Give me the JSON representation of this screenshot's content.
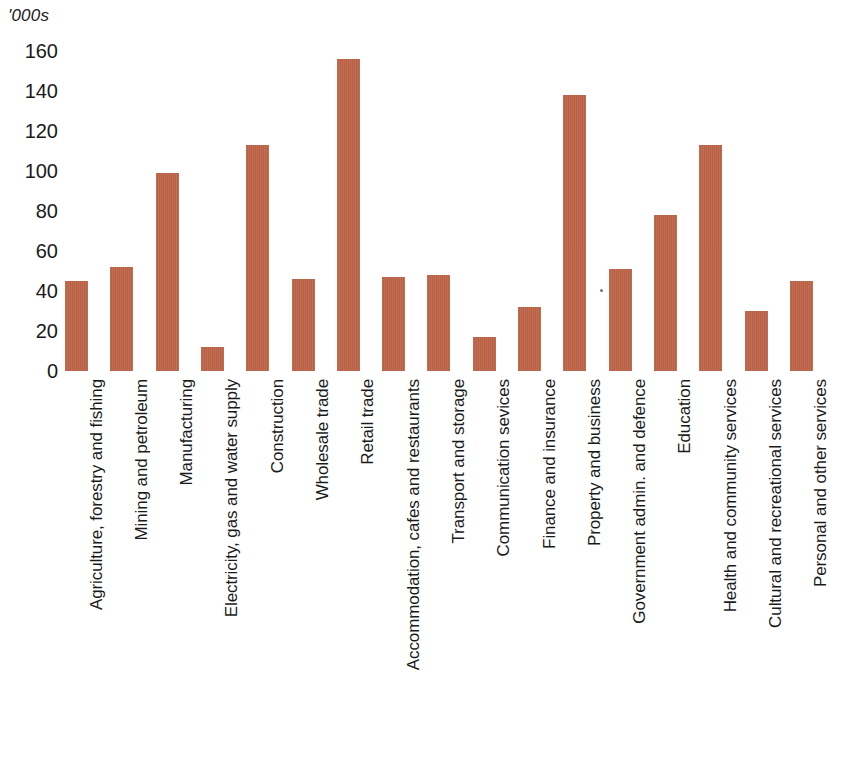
{
  "chart_data": {
    "type": "bar",
    "title": "",
    "subtitle": "",
    "xlabel": "",
    "ylabel": "'000s",
    "ylim": [
      0,
      160
    ],
    "ytick_step": 20,
    "yticks": [
      160,
      140,
      120,
      100,
      80,
      60,
      40,
      20,
      0
    ],
    "grid": false,
    "legend": "none",
    "bar_color": "#bf6549",
    "background_color": "#ffffff",
    "categories": [
      "Agriculture, forestry and fishing",
      "Mining and petroleum",
      "Manufacturing",
      "Electricity, gas and water supply",
      "Construction",
      "Wholesale trade",
      "Retail trade",
      "Accommodation, cafes and restaurants",
      "Transport and storage",
      "Communication sevices",
      "Finance and insurance",
      "Property and business",
      "Government admin. and defence",
      "Education",
      "Health and community services",
      "Cultural and recreational services",
      "Personal and other services"
    ],
    "values": [
      45,
      52,
      99,
      12,
      113,
      46,
      156,
      47,
      48,
      17,
      32,
      138,
      51,
      78,
      113,
      30,
      45
    ]
  }
}
